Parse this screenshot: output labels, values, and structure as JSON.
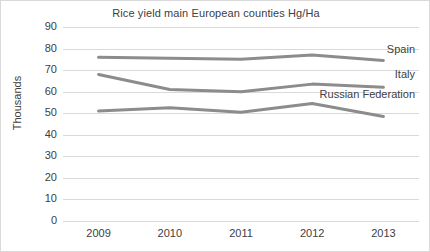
{
  "chart_data": {
    "type": "line",
    "title": "Rice yield main European counties Hg/Ha",
    "xlabel": "",
    "ylabel": "Thousands",
    "categories": [
      "2009",
      "2010",
      "2011",
      "2012",
      "2013"
    ],
    "x": [
      2009,
      2010,
      2011,
      2012,
      2013
    ],
    "ylim": [
      0,
      90
    ],
    "yticks": [
      0,
      10,
      20,
      30,
      40,
      50,
      60,
      70,
      80,
      90
    ],
    "ytick_labels": [
      "0",
      "10",
      "20",
      "30",
      "40",
      "50",
      "60",
      "70",
      "80",
      "90"
    ],
    "grid": true,
    "legend_position": "inline-right-labels",
    "series": [
      {
        "name": "Spain",
        "values": [
          76,
          75.5,
          75,
          77,
          74.5
        ],
        "color": "#8c8c8c",
        "label_x": 2013,
        "label_y": 80
      },
      {
        "name": "Italy",
        "values": [
          68,
          61,
          60,
          63.5,
          62
        ],
        "color": "#8c8c8c",
        "label_x": 2013,
        "label_y": 68
      },
      {
        "name": "Russian Federation",
        "values": [
          51,
          52.5,
          50.5,
          54.5,
          48.5
        ],
        "color": "#8c8c8c",
        "label_x": 2013,
        "label_y": 59
      }
    ],
    "annotations": [],
    "style": {
      "background": "#ffffff",
      "gridline_color": "#d9d9d9",
      "text_color": "#404040",
      "line_color": "#8c8c8c",
      "line_width": 3,
      "border_color": "#d9d9d9"
    }
  }
}
